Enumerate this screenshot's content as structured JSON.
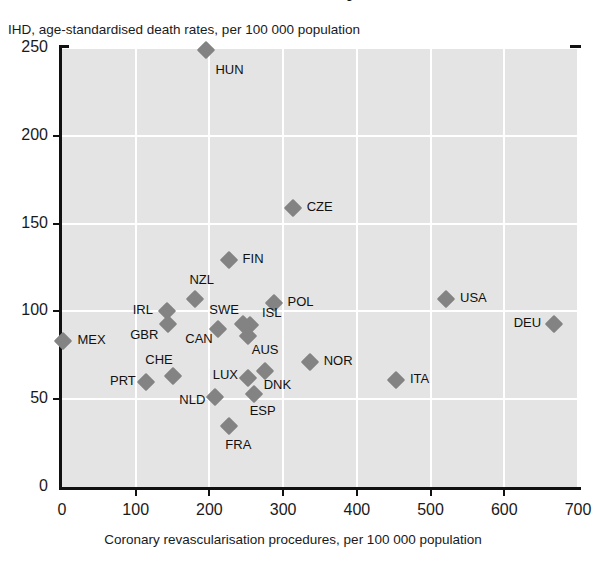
{
  "title": "Ischaemic heart disease mortality and revascularisation procedures, 2009",
  "axes": {
    "ylabel": "IHD, age-standardised death rates, per 100 000 population",
    "xlabel": "Coronary revascularisation procedures, per 100 000 population",
    "yticks": [
      "0",
      "50",
      "100",
      "150",
      "200",
      "250"
    ],
    "xticks": [
      "0",
      "100",
      "200",
      "300",
      "400",
      "500",
      "600",
      "700"
    ]
  },
  "chart_data": {
    "type": "scatter",
    "title": "Ischaemic heart disease mortality and revascularisation procedures, 2009",
    "xlabel": "Coronary revascularisation procedures, per 100 000 population",
    "ylabel": "IHD, age-standardised death rates, per 100 000 population",
    "xlim": [
      0,
      700
    ],
    "ylim": [
      0,
      250
    ],
    "xticks": [
      0,
      100,
      200,
      300,
      400,
      500,
      600,
      700
    ],
    "yticks": [
      0,
      50,
      100,
      150,
      200,
      250
    ],
    "grid": true,
    "legend": "none",
    "marker": "diamond",
    "marker_color": "#838383",
    "points": [
      {
        "label": "HUN",
        "x": 196,
        "y": 249,
        "lx": 9,
        "ly": 20
      },
      {
        "label": "CZE",
        "x": 313,
        "y": 159,
        "lx": 14,
        "ly": -1
      },
      {
        "label": "FIN",
        "x": 226,
        "y": 129,
        "lx": 14,
        "ly": -1
      },
      {
        "label": "NZL",
        "x": 181,
        "y": 107,
        "lx": -6,
        "ly": -19
      },
      {
        "label": "POL",
        "x": 287,
        "y": 105,
        "lx": 14,
        "ly": -1
      },
      {
        "label": "IRL",
        "x": 142,
        "y": 100,
        "lx": -34,
        "ly": -1
      },
      {
        "label": "GBR",
        "x": 144,
        "y": 93,
        "lx": -38,
        "ly": 11
      },
      {
        "label": "USA",
        "x": 521,
        "y": 107,
        "lx": 14,
        "ly": -1
      },
      {
        "label": "DEU",
        "x": 667,
        "y": 93,
        "lx": -40,
        "ly": -1
      },
      {
        "label": "SWE",
        "x": 246,
        "y": 93,
        "lx": -34,
        "ly": -14
      },
      {
        "label": "CAN",
        "x": 212,
        "y": 90,
        "lx": -33,
        "ly": 10
      },
      {
        "label": "ISL",
        "x": 255,
        "y": 92,
        "lx": 12,
        "ly": -12
      },
      {
        "label": "AUS",
        "x": 252,
        "y": 86,
        "lx": 4,
        "ly": 14
      },
      {
        "label": "MEX",
        "x": 2,
        "y": 83,
        "lx": 14,
        "ly": -1
      },
      {
        "label": "NOR",
        "x": 336,
        "y": 71,
        "lx": 14,
        "ly": -1
      },
      {
        "label": "CHE",
        "x": 151,
        "y": 63,
        "lx": -28,
        "ly": -16
      },
      {
        "label": "ITA",
        "x": 453,
        "y": 61,
        "lx": 14,
        "ly": -1
      },
      {
        "label": "PRT",
        "x": 114,
        "y": 60,
        "lx": -36,
        "ly": -1
      },
      {
        "label": "DNK",
        "x": 275,
        "y": 66,
        "lx": -1,
        "ly": 14
      },
      {
        "label": "LUX",
        "x": 252,
        "y": 62,
        "lx": -35,
        "ly": -3
      },
      {
        "label": "NLD",
        "x": 208,
        "y": 51,
        "lx": -36,
        "ly": 3
      },
      {
        "label": "ESP",
        "x": 260,
        "y": 53,
        "lx": -4,
        "ly": 17
      },
      {
        "label": "FRA",
        "x": 227,
        "y": 35,
        "lx": -4,
        "ly": 19
      }
    ]
  }
}
